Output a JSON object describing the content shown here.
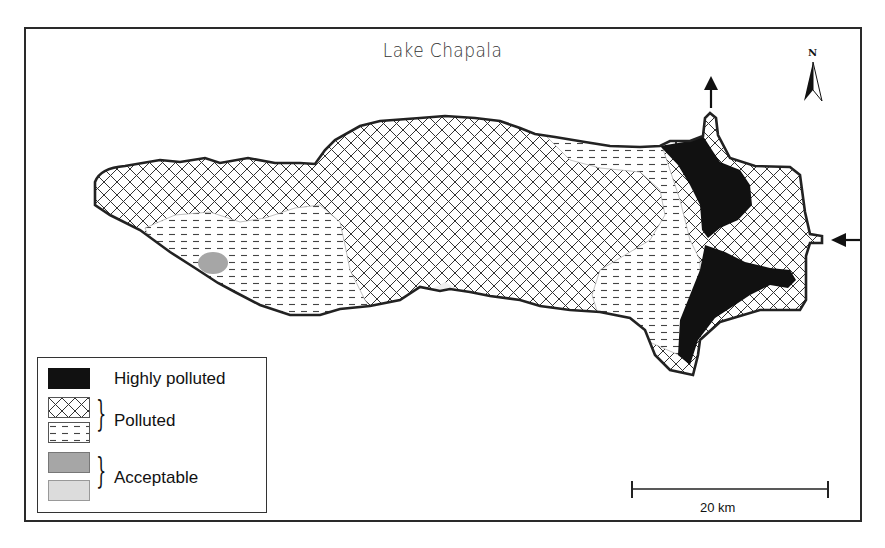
{
  "map": {
    "title": "Lake Chapala",
    "north_label": "N",
    "scale_bar_label": "20 km",
    "colors": {
      "highly_polluted": "#111111",
      "polluted_line": "#333333",
      "acceptable_dark": "#a6a6a6",
      "acceptable_light": "#dcdcdc",
      "outline": "#222222"
    },
    "flow_arrows": [
      {
        "direction": "outflow-north",
        "label": ""
      },
      {
        "direction": "inflow-east",
        "label": ""
      }
    ]
  },
  "legend": {
    "items": [
      {
        "label": "Highly polluted",
        "swatch": "solid-black"
      },
      {
        "label": "Polluted",
        "swatches": [
          "crosshatch",
          "dashed"
        ]
      },
      {
        "label": "Acceptable",
        "swatches": [
          "dark-gray",
          "light-gray"
        ]
      }
    ]
  }
}
